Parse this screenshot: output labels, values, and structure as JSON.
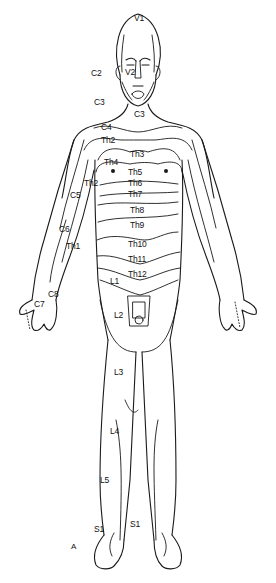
{
  "figure": {
    "panel_label": "A",
    "line_color": "#1a1a1a",
    "background": "#ffffff"
  },
  "labels": {
    "V1": "V1",
    "V2": "V2",
    "C2": "C2",
    "C3_face": "C3",
    "C3_neck": "C3",
    "C4": "C4",
    "Th2_chest": "Th2",
    "Th3": "Th3",
    "Th4": "Th4",
    "Th5": "Th5",
    "Th2_arm": "Th2",
    "Th6": "Th6",
    "Th7": "Th7",
    "Th8": "Th8",
    "Th9": "Th9",
    "Th10": "Th10",
    "Th11": "Th11",
    "Th12": "Th12",
    "C5": "C5",
    "C6": "C6",
    "Th1": "Th1",
    "C7": "C7",
    "C8": "C8",
    "L1": "L1",
    "L2": "L2",
    "L3": "L3",
    "L4": "L4",
    "L5": "L5",
    "S1_left": "S1",
    "S1_right": "S1"
  }
}
